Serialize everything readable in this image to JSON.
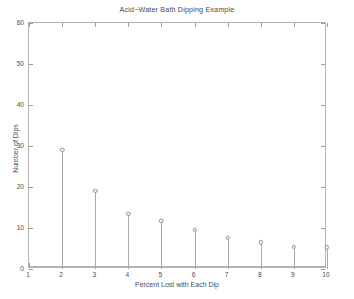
{
  "chart_data": {
    "type": "scatter",
    "plot_style": "stem",
    "title": "Acid−Water Bath Dipping Example",
    "xlabel": "Percent Lost with Each Dip",
    "ylabel": "Number of Dips",
    "x": [
      2,
      3,
      4,
      5,
      6,
      7,
      8,
      9,
      10
    ],
    "values": [
      29,
      19,
      13.5,
      11.7,
      9.6,
      7.6,
      6.5,
      5.4,
      5.3
    ],
    "xlim": [
      1,
      10
    ],
    "ylim": [
      0,
      60
    ],
    "xticks": [
      1,
      2,
      3,
      4,
      5,
      6,
      7,
      8,
      9,
      10
    ],
    "yticks": [
      0,
      10,
      20,
      30,
      40,
      50,
      60
    ],
    "xtick_labels": [
      "1",
      "2",
      "3",
      "4",
      "5",
      "6",
      "7",
      "8",
      "9",
      "10"
    ],
    "ytick_labels": [
      "0",
      "10",
      "20",
      "30",
      "40",
      "50",
      "60"
    ],
    "grid": false,
    "legend": null,
    "marker": "open-circle",
    "colors": {
      "axis": "#b3b3b3",
      "tick": "#9a9a9a",
      "text": "#4d4d4d",
      "stem": "#a8a8a8",
      "marker_edge": "#8f8f8f",
      "marker_face": "#ffffff",
      "background": "#ffffff"
    }
  }
}
